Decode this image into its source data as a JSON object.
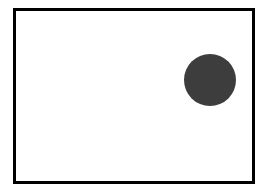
{
  "diagram": {
    "frame": {
      "border_color": "#000000",
      "background": "#ffffff"
    },
    "shapes": [
      {
        "type": "circle",
        "cx": 209.5,
        "cy": 79.5,
        "r": 26,
        "fill": "#3d3d3d"
      }
    ]
  }
}
